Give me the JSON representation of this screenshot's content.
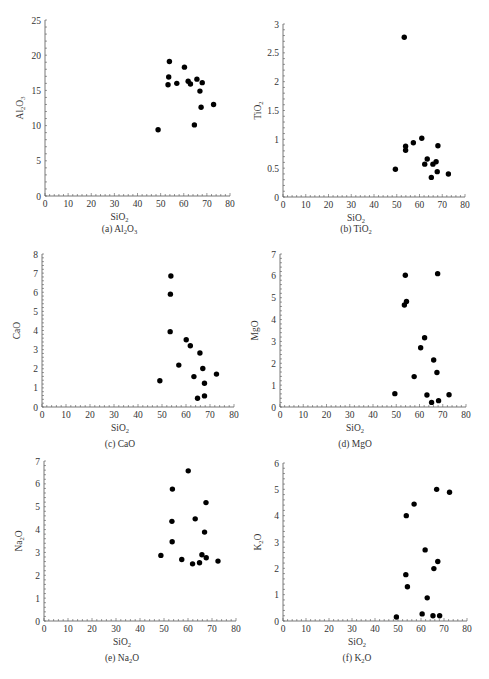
{
  "figure": {
    "panels_layout": "3 rows x 2 columns"
  },
  "chart_data": [
    {
      "type": "scatter",
      "panel": "a",
      "caption": "(a) Al2O3",
      "caption_parts": [
        "(a) Al",
        "2",
        "O",
        "3",
        ""
      ],
      "xlabel": "SiO2",
      "ylabel": "Al2O3",
      "xlim": [
        0,
        80
      ],
      "ylim": [
        0,
        25
      ],
      "xticks": [
        0,
        10,
        20,
        30,
        40,
        50,
        60,
        70,
        80
      ],
      "yticks": [
        0,
        5,
        10,
        15,
        20,
        25
      ],
      "grid": false,
      "legend": null,
      "x": [
        53.8,
        60.3,
        53.5,
        53.2,
        57.0,
        61.9,
        62.9,
        65.7,
        68.0,
        67.0,
        67.5,
        72.9,
        64.6,
        48.9
      ],
      "y": [
        19.1,
        18.3,
        16.9,
        15.8,
        16.0,
        16.3,
        15.9,
        16.6,
        16.1,
        14.9,
        12.6,
        13.0,
        10.1,
        9.4
      ]
    },
    {
      "type": "scatter",
      "panel": "b",
      "caption": "(b) TiO2",
      "xlabel": "SiO2",
      "ylabel": "TiO2",
      "xlim": [
        0,
        80
      ],
      "ylim": [
        0,
        3
      ],
      "xticks": [
        0,
        10,
        20,
        30,
        40,
        50,
        60,
        70,
        80
      ],
      "yticks": [
        0,
        0.5,
        1,
        1.5,
        2,
        2.5,
        3
      ],
      "grid": false,
      "legend": null,
      "x": [
        53.3,
        61.0,
        57.3,
        53.9,
        53.9,
        68.1,
        63.4,
        62.3,
        65.9,
        67.3,
        67.8,
        72.7,
        65.2,
        49.4
      ],
      "y": [
        2.77,
        1.02,
        0.94,
        0.88,
        0.81,
        0.89,
        0.66,
        0.57,
        0.57,
        0.61,
        0.44,
        0.4,
        0.34,
        0.48
      ]
    },
    {
      "type": "scatter",
      "panel": "c",
      "caption": "(c) CaO",
      "xlabel": "SiO2",
      "ylabel": "CaO",
      "xlim": [
        0,
        80
      ],
      "ylim": [
        0,
        8
      ],
      "xticks": [
        0,
        10,
        20,
        30,
        40,
        50,
        60,
        70,
        80
      ],
      "yticks": [
        0,
        1,
        2,
        3,
        4,
        5,
        6,
        7,
        8
      ],
      "grid": false,
      "legend": null,
      "x": [
        53.7,
        53.5,
        53.4,
        60.1,
        61.8,
        65.8,
        57.0,
        67.0,
        72.7,
        63.3,
        67.7,
        49.1,
        67.7,
        64.8
      ],
      "y": [
        6.85,
        5.9,
        3.94,
        3.52,
        3.2,
        2.82,
        2.19,
        2.01,
        1.72,
        1.59,
        1.24,
        1.37,
        0.58,
        0.46
      ]
    },
    {
      "type": "scatter",
      "panel": "d",
      "caption": "(d) MgO",
      "xlabel": "SiO2",
      "ylabel": "MgO",
      "xlim": [
        0,
        80
      ],
      "ylim": [
        0,
        7
      ],
      "xticks": [
        0,
        10,
        20,
        30,
        40,
        50,
        60,
        70,
        80
      ],
      "yticks": [
        0,
        1,
        2,
        3,
        4,
        5,
        6,
        7
      ],
      "grid": false,
      "legend": null,
      "x": [
        53.9,
        67.8,
        54.4,
        53.5,
        62.2,
        60.5,
        66.1,
        67.5,
        57.7,
        49.4,
        63.2,
        72.7,
        68.2,
        65.2
      ],
      "y": [
        6.03,
        6.1,
        4.83,
        4.67,
        3.17,
        2.71,
        2.15,
        1.58,
        1.39,
        0.61,
        0.55,
        0.56,
        0.29,
        0.21
      ]
    },
    {
      "type": "scatter",
      "panel": "e",
      "caption": "(e) Na2O",
      "xlabel": "SiO2",
      "ylabel": "Na2O",
      "xlim": [
        0,
        80
      ],
      "ylim": [
        0,
        7
      ],
      "xticks": [
        0,
        10,
        20,
        30,
        40,
        50,
        60,
        70,
        80
      ],
      "yticks": [
        0,
        1,
        2,
        3,
        4,
        5,
        6,
        7
      ],
      "grid": false,
      "legend": null,
      "x": [
        60.1,
        53.5,
        67.5,
        53.3,
        63.0,
        66.9,
        53.4,
        48.7,
        57.4,
        65.8,
        67.6,
        61.9,
        64.8,
        72.5
      ],
      "y": [
        6.57,
        5.77,
        5.18,
        4.36,
        4.47,
        3.89,
        3.47,
        2.87,
        2.69,
        2.9,
        2.77,
        2.5,
        2.55,
        2.62
      ]
    },
    {
      "type": "scatter",
      "panel": "f",
      "caption": "(f) K2O",
      "xlabel": "SiO2",
      "ylabel": "K2O",
      "xlim": [
        0,
        80
      ],
      "ylim": [
        0,
        6
      ],
      "xticks": [
        0,
        10,
        20,
        30,
        40,
        50,
        60,
        70,
        80
      ],
      "yticks": [
        0,
        1,
        2,
        3,
        4,
        5,
        6
      ],
      "grid": false,
      "legend": null,
      "x": [
        66.8,
        72.4,
        57.0,
        53.6,
        61.8,
        67.3,
        65.6,
        53.4,
        54.1,
        62.7,
        60.5,
        65.2,
        68.1,
        49.3
      ],
      "y": [
        5.0,
        4.89,
        4.44,
        4.0,
        2.7,
        2.26,
        1.99,
        1.76,
        1.3,
        0.88,
        0.27,
        0.2,
        0.2,
        0.15
      ]
    }
  ],
  "style": {
    "marker_color": "#000000",
    "axis_color": "#555555",
    "text_color": "#333333",
    "background": "#ffffff"
  }
}
